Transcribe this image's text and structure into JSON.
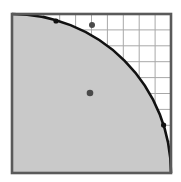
{
  "diagram": {
    "type": "quarter-circle-in-grid",
    "grid": {
      "rows": 10,
      "cols": 10
    },
    "colors": {
      "background": "#ffffff",
      "grid_line": "#a8a8a8",
      "border": "#5a5a5a",
      "region_fill": "#c9c9c9",
      "curve": "#111111",
      "dot": "#4a4a4a"
    },
    "points": [
      {
        "name": "dot-outside-region",
        "col": 5.0,
        "row_from_top": 0.7,
        "location": "outside"
      },
      {
        "name": "dot-inside-region",
        "col": 4.9,
        "row_from_top": 5.0,
        "location": "inside"
      },
      {
        "name": "dot-on-curve-top",
        "col": 2.8,
        "row_from_top": 0.75,
        "location": "on-curve"
      },
      {
        "name": "dot-on-curve-right",
        "col": 9.5,
        "row_from_top": 7.0,
        "location": "on-curve"
      }
    ]
  }
}
